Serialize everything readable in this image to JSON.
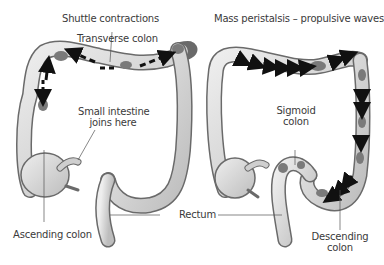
{
  "diagram": {
    "left_panel": {
      "title": "Shuttle contractions",
      "labels": {
        "transverse": "Transverse colon",
        "small_intestine_line1": "Small intestine",
        "small_intestine_line2": "joins here",
        "ascending": "Ascending colon"
      }
    },
    "right_panel": {
      "title": "Mass peristalsis – propulsive waves",
      "labels": {
        "sigmoid_line1": "Sigmoid",
        "sigmoid_line2": "colon",
        "descending_line1": "Descending",
        "descending_line2": "colon"
      }
    },
    "shared_labels": {
      "rectum": "Rectum"
    },
    "colors": {
      "colon_fill": "#d9d9d9",
      "colon_outline": "#6a6a6a",
      "feces": "#7a7a7a",
      "arrow": "#111111",
      "text": "#3a3a3a"
    }
  }
}
